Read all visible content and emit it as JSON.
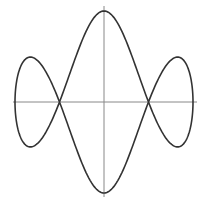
{
  "figure": {
    "colors": {
      "background": "#ffffff",
      "axis": "#888888",
      "curve": "#333333"
    },
    "canvas": {
      "width": 202,
      "height": 206
    },
    "origin": {
      "x": 104,
      "y": 102
    },
    "scale": {
      "x": 89,
      "y": 91
    },
    "axes": {
      "horizontal": {
        "x1": 13,
        "x2": 197,
        "y": 102
      },
      "vertical": {
        "x": 104,
        "y1": 6,
        "y2": 197
      }
    },
    "curve": {
      "x_expr": "sin(t)",
      "y_expr": "cos(t)*(1-4*sin(t)^2)/(1+1.43*sin(t)^2)",
      "B": 1.43,
      "samples": 400,
      "key_points": {
        "top": [
          0,
          1
        ],
        "bottom": [
          0,
          -1
        ],
        "crossings": [
          [
            -0.5,
            0
          ],
          [
            0.5,
            0
          ]
        ],
        "extremes_x": [
          [
            -1,
            0
          ],
          [
            1,
            0
          ]
        ],
        "lobe_peaks": [
          [
            -0.81,
            0.49
          ],
          [
            0.81,
            0.49
          ],
          [
            -0.81,
            -0.49
          ],
          [
            0.81,
            -0.49
          ]
        ]
      }
    }
  }
}
